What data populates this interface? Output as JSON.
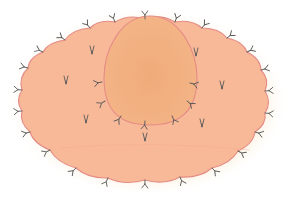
{
  "diagram": {
    "colors": {
      "background": "#ffffff",
      "glow": "#fbefd9",
      "outer_fill": "#f8b999",
      "inner_fill": "#f2b07f",
      "outline": "#e58c86",
      "marker": "#5a5a5a"
    },
    "outer_ellipse": {
      "cx": 147,
      "cy": 100,
      "rx": 127,
      "ry": 80,
      "scallops": 22
    },
    "inner_egg": {
      "cx": 150,
      "top": 16,
      "bottom": 125,
      "left": 104,
      "right": 197
    },
    "outer_markers": [
      [
        115,
        22
      ],
      [
        145,
        19
      ],
      [
        175,
        22
      ],
      [
        202,
        28
      ],
      [
        227,
        38
      ],
      [
        247,
        52
      ],
      [
        261,
        70
      ],
      [
        265,
        91
      ],
      [
        265,
        113
      ],
      [
        255,
        132
      ],
      [
        238,
        151
      ],
      [
        212,
        168
      ],
      [
        180,
        177
      ],
      [
        145,
        180
      ],
      [
        108,
        178
      ],
      [
        76,
        168
      ],
      [
        50,
        150
      ],
      [
        30,
        132
      ],
      [
        22,
        111
      ],
      [
        22,
        90
      ],
      [
        28,
        68
      ],
      [
        43,
        52
      ],
      [
        65,
        40
      ],
      [
        90,
        28
      ]
    ],
    "inner_markers": [
      [
        102,
        82
      ],
      [
        105,
        101
      ],
      [
        121,
        116
      ],
      [
        145,
        121
      ],
      [
        172,
        116
      ],
      [
        187,
        101
      ],
      [
        190,
        83
      ]
    ],
    "interior_v_marks": [
      [
        92,
        50
      ],
      [
        66,
        80
      ],
      [
        86,
        119
      ],
      [
        145,
        137
      ],
      [
        196,
        52
      ],
      [
        222,
        85
      ],
      [
        202,
        123
      ]
    ]
  }
}
